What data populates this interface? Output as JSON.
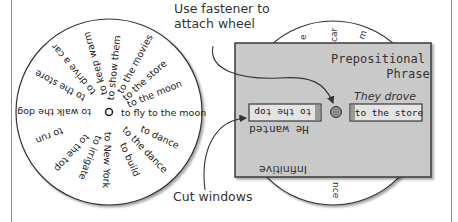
{
  "wheel": {
    "center_label": "o",
    "phrases": [
      {
        "text": "to fly to the moon",
        "angle": 0,
        "r": 12
      },
      {
        "text": "to the moon",
        "angle": -22,
        "r": 20
      },
      {
        "text": "to the store",
        "angle": -42,
        "r": 20
      },
      {
        "text": "to the movies",
        "angle": -62,
        "r": 22
      },
      {
        "text": "to show them",
        "angle": -84,
        "r": 12
      },
      {
        "text": "to keep warm",
        "angle": -106,
        "r": 18
      },
      {
        "text": "to drive a car",
        "angle": -130,
        "r": 24
      },
      {
        "text": "to the store",
        "angle": -152,
        "r": 28
      },
      {
        "text": "to walk the dog",
        "angle": 180,
        "r": 18
      },
      {
        "text": "to run",
        "angle": 158,
        "r": 50
      },
      {
        "text": "to the top",
        "angle": 132,
        "r": 32
      },
      {
        "text": "to irrigate",
        "angle": 112,
        "r": 26
      },
      {
        "text": "to New York",
        "angle": 92,
        "r": 20
      },
      {
        "text": "to build",
        "angle": 66,
        "r": 34
      },
      {
        "text": "to the dance",
        "angle": 46,
        "r": 22
      },
      {
        "text": "to dance",
        "angle": 26,
        "r": 36
      }
    ]
  },
  "back_wheel_fragments": {
    "top": [
      "e",
      "car",
      "m"
    ],
    "bottom": [
      "nce"
    ]
  },
  "card": {
    "title_line1": "Prepositional",
    "title_line2": "Phrase",
    "prep_label": "They drove",
    "prep_window": "to the store",
    "inf_label": "He wanted",
    "inf_window": "to the top",
    "inf_title": "Infinitive"
  },
  "callouts": {
    "fastener": "Use fastener to\nattach wheel",
    "windows": "Cut windows"
  },
  "colors": {
    "card_fill": "#c9c9c9",
    "card_border": "#3a3a3a",
    "window_fill": "#e4e4e4",
    "fastener": "#8c8c8c",
    "text": "#333333"
  }
}
